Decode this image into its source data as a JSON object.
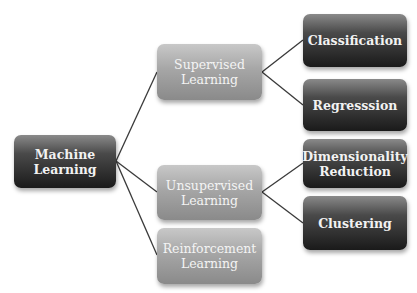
{
  "diagram": {
    "type": "tree",
    "root": {
      "id": "ml",
      "label_line1": "Machine",
      "label_line2": "Learning"
    },
    "categories": [
      {
        "id": "supervised",
        "label_line1": "Supervised",
        "label_line2": "Learning"
      },
      {
        "id": "unsupervised",
        "label_line1": "Unsupervised",
        "label_line2": "Learning"
      },
      {
        "id": "reinforcement",
        "label_line1": "Reinforcement",
        "label_line2": "Learning"
      }
    ],
    "leaves": [
      {
        "id": "classification",
        "parent": "supervised",
        "label_line1": "Classification"
      },
      {
        "id": "regression",
        "parent": "supervised",
        "label_line1": "Regresssion"
      },
      {
        "id": "dimred",
        "parent": "unsupervised",
        "label_line1": "Dimensionality",
        "label_line2": "Reduction"
      },
      {
        "id": "clustering",
        "parent": "unsupervised",
        "label_line1": "Clustering"
      }
    ],
    "edges": [
      [
        "ml",
        "supervised"
      ],
      [
        "ml",
        "unsupervised"
      ],
      [
        "ml",
        "reinforcement"
      ],
      [
        "supervised",
        "classification"
      ],
      [
        "supervised",
        "regression"
      ],
      [
        "unsupervised",
        "dimred"
      ],
      [
        "unsupervised",
        "clustering"
      ]
    ],
    "colors": {
      "dark_node": "#1a1a1a",
      "light_node": "#a6a6a6",
      "edge": "#333333",
      "text": "#f2f2f2"
    }
  }
}
